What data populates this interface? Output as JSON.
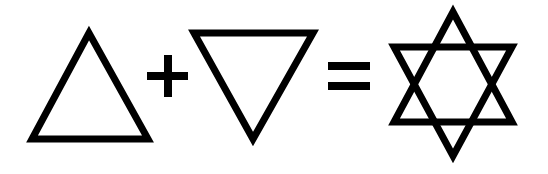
{
  "diagram": {
    "description": "Upward triangle plus downward triangle equals hexagram (six-pointed star)",
    "stroke_color": "#000000",
    "background_color": "#ffffff",
    "elements": [
      {
        "id": "up-triangle",
        "label": "Upward triangle"
      },
      {
        "id": "plus",
        "label": "+"
      },
      {
        "id": "down-triangle",
        "label": "Downward triangle"
      },
      {
        "id": "equals",
        "label": "="
      },
      {
        "id": "hexagram",
        "label": "Six-pointed star"
      }
    ]
  }
}
